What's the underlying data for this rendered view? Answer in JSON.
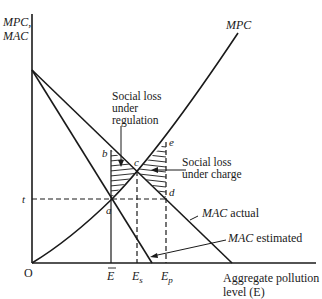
{
  "axes": {
    "y_label_line1": "MPC,",
    "y_label_line2": "MAC",
    "origin": "O",
    "x_label_line1": "Aggregate pollution",
    "x_label_line2": "level (E)"
  },
  "curves": {
    "mpc": "MPC",
    "mac_actual_italic": "MAC",
    "mac_actual_rest": " actual",
    "mac_estimated_italic": "MAC",
    "mac_estimated_rest": " estimated"
  },
  "points": {
    "a": "a",
    "b": "b",
    "c": "c",
    "d": "d",
    "e": "e",
    "t": "t"
  },
  "x_ticks": {
    "e_bar": "E",
    "e_s_main": "E",
    "e_s_sub": "s",
    "e_p_main": "E",
    "e_p_sub": "p"
  },
  "annotations": {
    "regulation_line1": "Social loss",
    "regulation_line2": "under",
    "regulation_line3": "regulation",
    "charge_line1": "Social loss",
    "charge_line2": "under charge"
  },
  "colors": {
    "ink": "#1a1a1a",
    "background": "#ffffff"
  }
}
